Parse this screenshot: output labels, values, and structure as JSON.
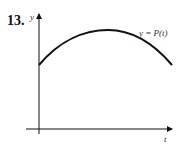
{
  "problem_number": "13.",
  "axes": {
    "y_label": "y",
    "x_label": "t"
  },
  "curve": {
    "label": "y = P(t)",
    "color": "#111111",
    "shape": "concave-down arc"
  }
}
